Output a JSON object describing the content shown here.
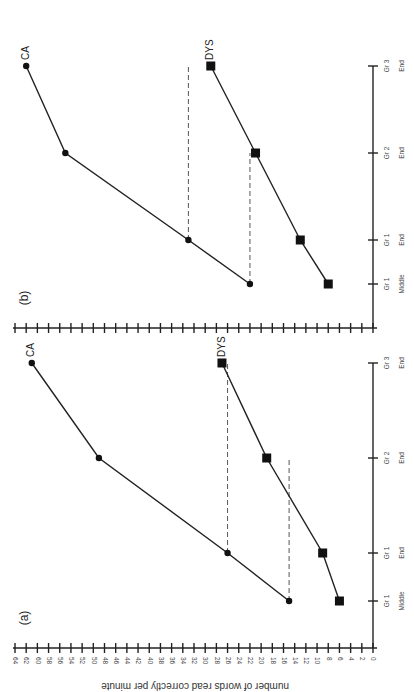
{
  "chart_data": [
    {
      "type": "line",
      "panel": "(a)",
      "title": "",
      "xlabel": "",
      "ylabel": "number of words read correctly per minute",
      "ylim": [
        0,
        64
      ],
      "yticks": [
        0,
        2,
        4,
        6,
        8,
        10,
        12,
        14,
        16,
        18,
        20,
        22,
        24,
        26,
        28,
        30,
        32,
        34,
        36,
        38,
        40,
        42,
        44,
        46,
        48,
        50,
        52,
        54,
        56,
        58,
        60,
        62,
        64
      ],
      "categories": [
        {
          "line1": "Gr 1",
          "line2": "Middle"
        },
        {
          "line1": "Gr 1",
          "line2": "End"
        },
        {
          "line1": "Gr 2",
          "line2": "End"
        },
        {
          "line1": "Gr 3",
          "line2": "End"
        }
      ],
      "series": [
        {
          "name": "CA",
          "marker": "circle",
          "values": [
            15,
            26,
            49,
            61
          ]
        },
        {
          "name": "DYS",
          "marker": "square",
          "values": [
            6,
            9,
            19,
            27
          ]
        }
      ],
      "reference_lines": [
        {
          "value": 15,
          "from_category": 0,
          "to_category": 2
        },
        {
          "value": 26,
          "from_category": 1,
          "to_category": 3
        }
      ],
      "grid": false
    },
    {
      "type": "line",
      "panel": "(b)",
      "title": "",
      "xlabel": "",
      "ylabel": "",
      "ylim": [
        0,
        64
      ],
      "categories": [
        {
          "line1": "Gr 1",
          "line2": "Middle"
        },
        {
          "line1": "Gr 1",
          "line2": "End"
        },
        {
          "line1": "Gr 2",
          "line2": "End"
        },
        {
          "line1": "Gr 3",
          "line2": "End"
        }
      ],
      "series": [
        {
          "name": "CA",
          "marker": "circle",
          "values": [
            22,
            33,
            55,
            62
          ]
        },
        {
          "name": "DYS",
          "marker": "square",
          "values": [
            8,
            13,
            21,
            29
          ]
        }
      ],
      "reference_lines": [
        {
          "value": 22,
          "from_category": 0,
          "to_category": 2
        },
        {
          "value": 33,
          "from_category": 1,
          "to_category": 3
        }
      ],
      "grid": false
    }
  ]
}
